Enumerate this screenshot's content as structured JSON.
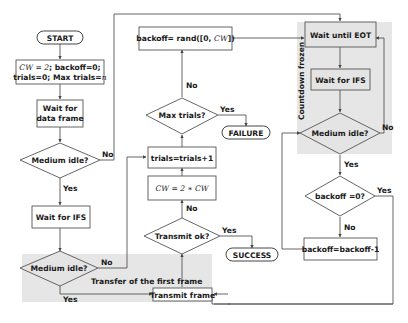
{
  "diagram": {
    "type": "flowchart",
    "terminals": {
      "start": "START",
      "failure": "FAILURE",
      "success": "SUCCESS"
    },
    "processes": {
      "init_line1_math": "CW = 2",
      "init_line1_rest": "; backoff=0;",
      "init_line2_text": "trials=0; Max trials=",
      "init_line2_math": "n",
      "wait_data": [
        "Wait for",
        "data frame"
      ],
      "wait_ifs_left": "Wait for IFS",
      "transmit_frame": "Transmit frame",
      "backoff_rand_text": "backoff= rand([0, ",
      "backoff_rand_math": "CW",
      "backoff_rand_end": "])",
      "trials_inc": "trials=trials+1",
      "cw_double": "CW = 2 ∗ CW",
      "wait_eot": "Wait until EOT",
      "wait_ifs_right": "Wait for IFS",
      "backoff_dec": "backoff=backoff-1"
    },
    "decisions": {
      "medium_idle_1": "Medium idle?",
      "medium_idle_2": "Medium idle?",
      "max_trials": "Max trials?",
      "transmit_ok": "Transmit ok?",
      "medium_idle_3": "Medium idle?",
      "backoff_zero": "backoff =0?"
    },
    "edge_labels": {
      "yes": "Yes",
      "no": "No"
    },
    "regions": {
      "transfer_first": "Transfer of the first frame",
      "countdown_frozen": "Countdown frozen"
    },
    "colors": {
      "region_fill": "#e6e6e6",
      "stroke": "#555555",
      "text": "#1a1a1a"
    }
  }
}
